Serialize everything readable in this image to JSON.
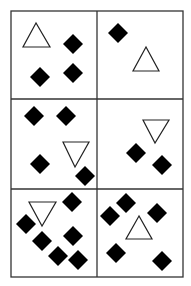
{
  "diagram": {
    "width": 191,
    "height": 286,
    "background": "#ffffff",
    "grid": {
      "left": 11,
      "top": 11,
      "right": 183,
      "bottom": 277,
      "col_x": [
        11,
        97,
        183
      ],
      "row_y": [
        11,
        99,
        189,
        277
      ],
      "line_color": "#333333",
      "line_width": 1.3
    },
    "colors": {
      "diamond_fill": "#000000",
      "triangle_stroke": "#222222",
      "triangle_fill": "#ffffff"
    },
    "diamond_half_size": 10,
    "cells": [
      {
        "name": "cell-1",
        "triangle": {
          "direction": "up",
          "points": [
            [
              36,
              23
            ],
            [
              23,
              47
            ],
            [
              50,
              47
            ]
          ]
        },
        "diamonds": [
          [
            73,
            44
          ],
          [
            40,
            77
          ],
          [
            73,
            73
          ]
        ]
      },
      {
        "name": "cell-2",
        "triangle": {
          "direction": "up",
          "points": [
            [
              146,
              47
            ],
            [
              133,
              71
            ],
            [
              159,
              71
            ]
          ]
        },
        "diamonds": [
          [
            118,
            33
          ]
        ]
      },
      {
        "name": "cell-3",
        "triangle": {
          "direction": "down",
          "points": [
            [
              63,
              142
            ],
            [
              89,
              142
            ],
            [
              75,
              167
            ]
          ]
        },
        "diamonds": [
          [
            34,
            116
          ],
          [
            66,
            116
          ],
          [
            40,
            164
          ],
          [
            85,
            176
          ]
        ]
      },
      {
        "name": "cell-4",
        "triangle": {
          "direction": "down",
          "points": [
            [
              143,
              120
            ],
            [
              169,
              120
            ],
            [
              155,
              143
            ]
          ]
        },
        "diamonds": [
          [
            136,
            153
          ],
          [
            162,
            165
          ]
        ]
      },
      {
        "name": "cell-5",
        "triangle": {
          "direction": "down",
          "points": [
            [
              29,
              202
            ],
            [
              56,
              202
            ],
            [
              42,
              226
            ]
          ]
        },
        "diamonds": [
          [
            72,
            202
          ],
          [
            26,
            224
          ],
          [
            42,
            241
          ],
          [
            73,
            236
          ],
          [
            58,
            256
          ],
          [
            78,
            260
          ]
        ]
      },
      {
        "name": "cell-6",
        "triangle": {
          "direction": "up",
          "points": [
            [
              139,
              216
            ],
            [
              126,
              239
            ],
            [
              152,
              239
            ]
          ]
        },
        "diamonds": [
          [
            126,
            203
          ],
          [
            110,
            216
          ],
          [
            157,
            213
          ],
          [
            116,
            253
          ],
          [
            162,
            261
          ]
        ]
      }
    ]
  }
}
